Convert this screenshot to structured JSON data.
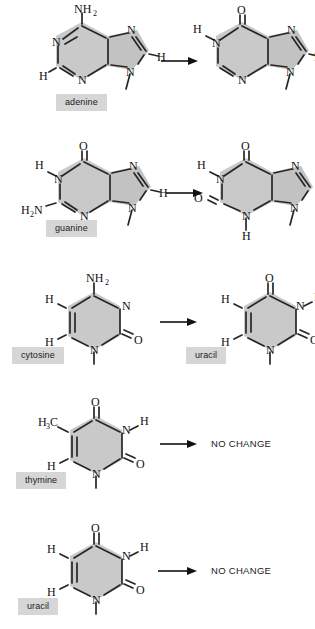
{
  "document": {
    "title": "Spontaneous deamination of DNA bases",
    "background_color": "#ffffff",
    "label_background_color": "#d6d6d6",
    "ring_fill_color": "#c9c9c9",
    "bond_color": "#262626"
  },
  "rows": [
    {
      "id": "adenine-row",
      "label": "adenine",
      "reactant_name": "adenine",
      "product_name": "hypoxanthine",
      "result_type": "structure",
      "reactant_atoms": [
        "NH2",
        "N",
        "N",
        "N",
        "N",
        "H",
        "H"
      ],
      "product_atoms": [
        "O",
        "H",
        "N",
        "N",
        "N",
        "N",
        "H"
      ],
      "reactant_substituent": "NH2",
      "product_substituent": "O"
    },
    {
      "id": "guanine-row",
      "label": "guanine",
      "reactant_name": "guanine",
      "product_name": "xanthine",
      "result_type": "structure",
      "reactant_atoms": [
        "O",
        "H",
        "N",
        "H2N",
        "N",
        "N",
        "N",
        "H"
      ],
      "product_atoms": [
        "O",
        "H",
        "N",
        "O",
        "N",
        "H",
        "N",
        "N",
        "H"
      ],
      "reactant_substituent": "H2N",
      "product_substituent": "O"
    },
    {
      "id": "cytosine-row",
      "label": "cytosine",
      "reactant_name": "cytosine",
      "product_name": "uracil",
      "product_label": "uracil",
      "result_type": "structure",
      "reactant_atoms": [
        "NH2",
        "H",
        "H",
        "N",
        "N",
        "O"
      ],
      "product_atoms": [
        "O",
        "H",
        "H",
        "N",
        "H",
        "N",
        "O"
      ],
      "reactant_substituent": "NH2",
      "product_substituent": "O"
    },
    {
      "id": "thymine-row",
      "label": "thymine",
      "reactant_name": "thymine",
      "result_type": "text",
      "result_text": "NO CHANGE",
      "reactant_atoms": [
        "H3C",
        "O",
        "N",
        "H",
        "H",
        "N",
        "O"
      ],
      "reactant_substituent": "H3C"
    },
    {
      "id": "uracil-row",
      "label": "uracil",
      "reactant_name": "uracil",
      "result_type": "text",
      "result_text": "NO CHANGE",
      "reactant_atoms": [
        "O",
        "H",
        "N",
        "H",
        "H",
        "N",
        "O"
      ],
      "reactant_substituent": "H"
    }
  ],
  "atom_labels": {
    "nitrogen": "N",
    "oxygen": "O",
    "hydrogen": "H",
    "amino": "NH",
    "amino_sub": "2",
    "amino_left": "H",
    "amino_left_sub": "2",
    "amino_left_n": "N",
    "methyl": "H",
    "methyl_sub": "3",
    "methyl_c": "C"
  },
  "arrow": {
    "name": "reaction-arrow",
    "direction": "right"
  }
}
